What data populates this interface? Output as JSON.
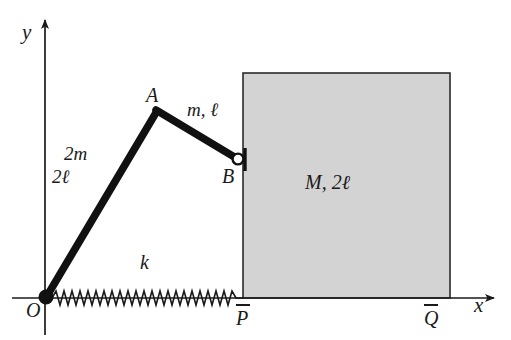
{
  "figure": {
    "background_color": "#ffffff",
    "ink_color": "#1a1a1a",
    "block_fill_color": "#d3d3d3",
    "block_stroke_color": "#2b2b2b",
    "link_color": "#111111"
  },
  "axes": {
    "x_label": "x",
    "y_label": "y",
    "origin_label": "O"
  },
  "points": {
    "origin": "O",
    "apex": "A",
    "joint": "B",
    "block_left": "P",
    "block_right": "Q"
  },
  "links": {
    "lower": {
      "mass_label": "2m",
      "length_label": "2ℓ"
    },
    "upper": {
      "combined_label": "m, ℓ"
    }
  },
  "spring": {
    "label": "k"
  },
  "block": {
    "label": "M, 2ℓ"
  },
  "geometry": {
    "origin_px": [
      45,
      298
    ],
    "apex_px": [
      157,
      110
    ],
    "joint_px": [
      239,
      159
    ],
    "block_left_px": 243,
    "block_right_px": 450,
    "block_top_px": 73,
    "block_bottom_px": 298,
    "x_axis_end_px": 500,
    "y_axis_top_px": 14
  }
}
